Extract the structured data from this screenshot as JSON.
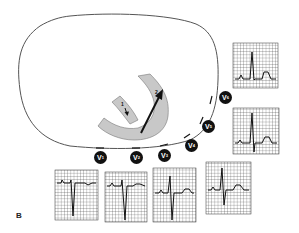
{
  "figure": {
    "panel_label": "B",
    "colors": {
      "outline": "#555555",
      "heart_fill": "#c8c8c8",
      "heart_stroke": "#777777",
      "arrow": "#111111",
      "label_bg": "#111111",
      "label_text": "#ffffff",
      "grid": "#333333"
    },
    "vectors": [
      {
        "label": "1",
        "description": "small septal vector arrow"
      },
      {
        "label": "2",
        "description": "large left ventricular vector arrow"
      }
    ],
    "leads": [
      {
        "id": "V1",
        "letter": "V",
        "num": "1",
        "x": 94,
        "y": 151
      },
      {
        "id": "V2",
        "letter": "V",
        "num": "2",
        "x": 130,
        "y": 151
      },
      {
        "id": "V3",
        "letter": "V",
        "num": "3",
        "x": 158,
        "y": 149
      },
      {
        "id": "V4",
        "letter": "V",
        "num": "4",
        "x": 185,
        "y": 139
      },
      {
        "id": "V5",
        "letter": "V",
        "num": "5",
        "x": 202,
        "y": 120
      },
      {
        "id": "V6",
        "letter": "V",
        "num": "6",
        "x": 219,
        "y": 91
      }
    ],
    "ecg_strips": [
      {
        "lead": "V6",
        "x": 233,
        "y": 43,
        "w": 45,
        "h": 45,
        "pattern": "tall R, small S, upright T"
      },
      {
        "lead": "V5",
        "x": 233,
        "y": 108,
        "w": 46,
        "h": 46,
        "pattern": "tall R, small S, upright T"
      },
      {
        "lead": "V1",
        "x": 55,
        "y": 170,
        "w": 43,
        "h": 50,
        "pattern": "small r, deep S"
      },
      {
        "lead": "V2",
        "x": 105,
        "y": 172,
        "w": 42,
        "h": 50,
        "pattern": "small r, deep S"
      },
      {
        "lead": "V3",
        "x": 153,
        "y": 168,
        "w": 43,
        "h": 54,
        "pattern": "RS transition"
      },
      {
        "lead": "V4",
        "x": 206,
        "y": 162,
        "w": 45,
        "h": 52,
        "pattern": "dominant R, S, upright T"
      }
    ]
  }
}
